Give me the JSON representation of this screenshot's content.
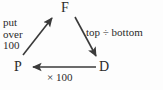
{
  "diagram": {
    "type": "cycle-conversion-triangle",
    "nodes": [
      {
        "id": "F",
        "label": "F",
        "role": "fraction"
      },
      {
        "id": "P",
        "label": "P",
        "role": "percent"
      },
      {
        "id": "D",
        "label": "D",
        "role": "decimal"
      }
    ],
    "edges": [
      {
        "id": "p-to-f",
        "from": "P",
        "to": "F",
        "label_lines": [
          "put",
          "over",
          "100"
        ],
        "direction": "up-right"
      },
      {
        "id": "f-to-d",
        "from": "F",
        "to": "D",
        "label": "top ÷ bottom",
        "direction": "down-right"
      },
      {
        "id": "d-to-p",
        "from": "D",
        "to": "P",
        "label": "× 100",
        "direction": "left"
      }
    ],
    "colors": {
      "ink": "#2b2b2b",
      "stroke": "#3a3a3a",
      "background": "#fdfdfd"
    }
  }
}
